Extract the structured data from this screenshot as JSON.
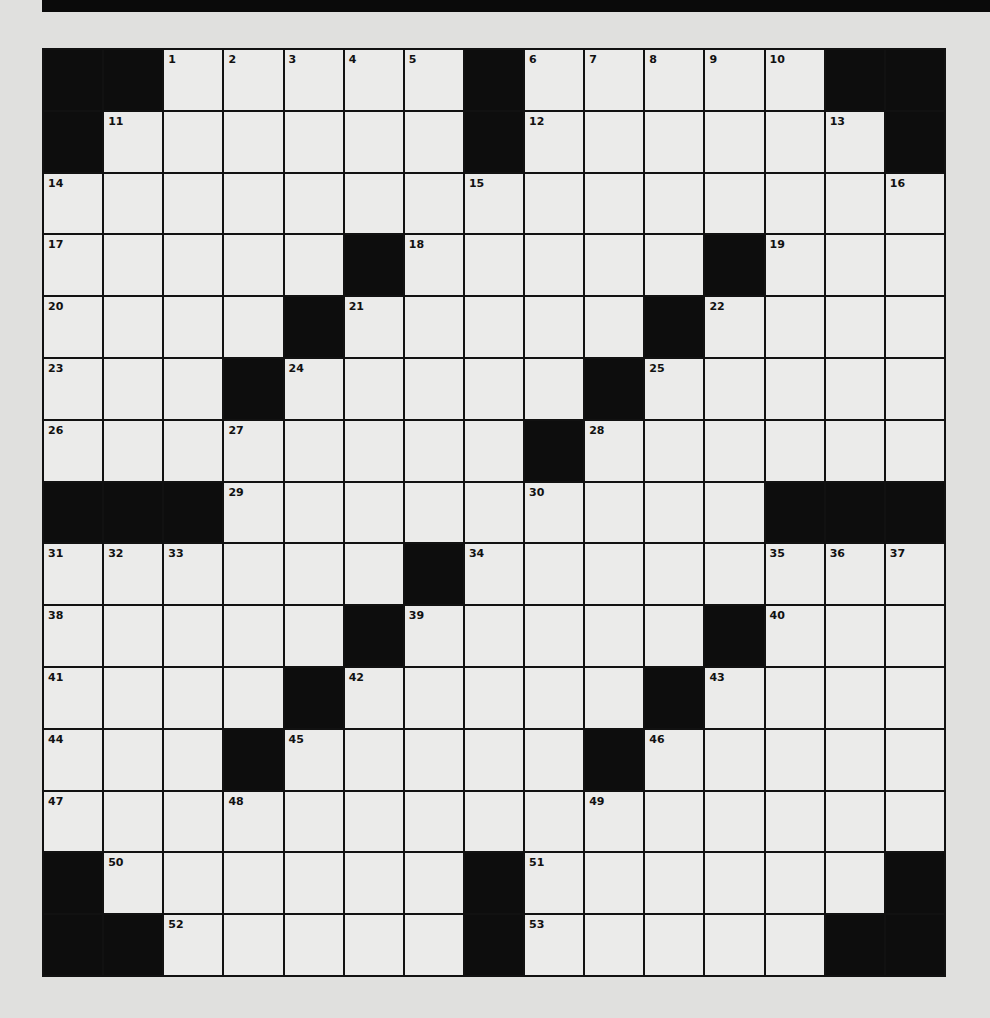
{
  "puzzle": {
    "rows": 15,
    "cols": 15,
    "colors": {
      "black": "#0d0d0d",
      "cell": "#ebebea",
      "background": "#e0e0de"
    },
    "layout": [
      "##.....#.....##",
      "#......#......#",
      "...............",
      ".....#.....#...",
      "....#.....#....",
      "...#.....#.....",
      "........#......",
      "###.........###",
      "......#........",
      ".....#.....#...",
      "....#.....#....",
      "...#.....#.....",
      "...............",
      "#......#......#",
      "##.....#.....##"
    ],
    "numbers": [
      {
        "r": 0,
        "c": 2,
        "n": "1"
      },
      {
        "r": 0,
        "c": 3,
        "n": "2"
      },
      {
        "r": 0,
        "c": 4,
        "n": "3"
      },
      {
        "r": 0,
        "c": 5,
        "n": "4"
      },
      {
        "r": 0,
        "c": 6,
        "n": "5"
      },
      {
        "r": 0,
        "c": 8,
        "n": "6"
      },
      {
        "r": 0,
        "c": 9,
        "n": "7"
      },
      {
        "r": 0,
        "c": 10,
        "n": "8"
      },
      {
        "r": 0,
        "c": 11,
        "n": "9"
      },
      {
        "r": 0,
        "c": 12,
        "n": "10"
      },
      {
        "r": 1,
        "c": 1,
        "n": "11"
      },
      {
        "r": 1,
        "c": 8,
        "n": "12"
      },
      {
        "r": 1,
        "c": 13,
        "n": "13"
      },
      {
        "r": 2,
        "c": 0,
        "n": "14"
      },
      {
        "r": 2,
        "c": 7,
        "n": "15"
      },
      {
        "r": 2,
        "c": 14,
        "n": "16"
      },
      {
        "r": 3,
        "c": 0,
        "n": "17"
      },
      {
        "r": 3,
        "c": 6,
        "n": "18"
      },
      {
        "r": 3,
        "c": 12,
        "n": "19"
      },
      {
        "r": 4,
        "c": 0,
        "n": "20"
      },
      {
        "r": 4,
        "c": 5,
        "n": "21"
      },
      {
        "r": 4,
        "c": 11,
        "n": "22"
      },
      {
        "r": 5,
        "c": 0,
        "n": "23"
      },
      {
        "r": 5,
        "c": 4,
        "n": "24"
      },
      {
        "r": 5,
        "c": 10,
        "n": "25"
      },
      {
        "r": 6,
        "c": 0,
        "n": "26"
      },
      {
        "r": 6,
        "c": 3,
        "n": "27"
      },
      {
        "r": 6,
        "c": 9,
        "n": "28"
      },
      {
        "r": 7,
        "c": 3,
        "n": "29"
      },
      {
        "r": 7,
        "c": 8,
        "n": "30"
      },
      {
        "r": 8,
        "c": 0,
        "n": "31"
      },
      {
        "r": 8,
        "c": 1,
        "n": "32"
      },
      {
        "r": 8,
        "c": 2,
        "n": "33"
      },
      {
        "r": 8,
        "c": 7,
        "n": "34"
      },
      {
        "r": 8,
        "c": 12,
        "n": "35"
      },
      {
        "r": 8,
        "c": 13,
        "n": "36"
      },
      {
        "r": 8,
        "c": 14,
        "n": "37"
      },
      {
        "r": 9,
        "c": 0,
        "n": "38"
      },
      {
        "r": 9,
        "c": 6,
        "n": "39"
      },
      {
        "r": 9,
        "c": 12,
        "n": "40"
      },
      {
        "r": 10,
        "c": 0,
        "n": "41"
      },
      {
        "r": 10,
        "c": 5,
        "n": "42"
      },
      {
        "r": 10,
        "c": 11,
        "n": "43"
      },
      {
        "r": 11,
        "c": 0,
        "n": "44"
      },
      {
        "r": 11,
        "c": 4,
        "n": "45"
      },
      {
        "r": 11,
        "c": 10,
        "n": "46"
      },
      {
        "r": 12,
        "c": 0,
        "n": "47"
      },
      {
        "r": 12,
        "c": 3,
        "n": "48"
      },
      {
        "r": 12,
        "c": 9,
        "n": "49"
      },
      {
        "r": 13,
        "c": 1,
        "n": "50"
      },
      {
        "r": 13,
        "c": 8,
        "n": "51"
      },
      {
        "r": 14,
        "c": 2,
        "n": "52"
      },
      {
        "r": 14,
        "c": 8,
        "n": "53"
      }
    ]
  }
}
